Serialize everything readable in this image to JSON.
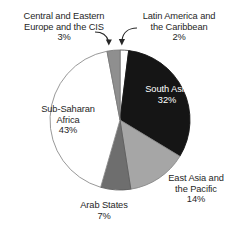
{
  "chart_data": {
    "type": "pie",
    "title": "",
    "subtitle": "",
    "xlabel": "",
    "ylabel": "",
    "grid": false,
    "legend_position": "none",
    "label_format": "name + percent",
    "start_angle_deg": 0,
    "direction": "clockwise",
    "categories": [
      "Latin America and the Caribbean",
      "South Asia",
      "East Asia and the Pacific",
      "Arab States",
      "Sub-Saharan Africa",
      "Central and Eastern Europe and the CIS"
    ],
    "values": [
      2,
      32,
      14,
      7,
      43,
      3
    ],
    "unit": "%",
    "total": 101,
    "slices": [
      {
        "name": "Latin America and the Caribbean",
        "label_line1": "Latin America and",
        "label_line2": "the Caribbean",
        "value": 2,
        "percent_label": "2%",
        "color": "#ffffff",
        "stroke": "#555555",
        "label_placement": "outside-leader"
      },
      {
        "name": "South Asia",
        "label_line1": "South Asia",
        "label_line2": "",
        "value": 32,
        "percent_label": "32%",
        "color": "#151515",
        "stroke": "#151515",
        "label_placement": "inside"
      },
      {
        "name": "East Asia and the Pacific",
        "label_line1": "East Asia and",
        "label_line2": "the Pacific",
        "value": 14,
        "percent_label": "14%",
        "color": "#a6a6a6",
        "stroke": "#8a8a8a",
        "label_placement": "outside"
      },
      {
        "name": "Arab States",
        "label_line1": "Arab States",
        "label_line2": "",
        "value": 7,
        "percent_label": "7%",
        "color": "#6e6e6e",
        "stroke": "#5e5e5e",
        "label_placement": "outside"
      },
      {
        "name": "Sub-Saharan Africa",
        "label_line1": "Sub-Saharan",
        "label_line2": "Africa",
        "value": 43,
        "percent_label": "43%",
        "color": "#ffffff",
        "stroke": "#8c8c8c",
        "label_placement": "inside"
      },
      {
        "name": "Central and Eastern Europe and the CIS",
        "label_line1": "Central and Eastern",
        "label_line2": "Europe and the CIS",
        "value": 3,
        "percent_label": "3%",
        "color": "#8f8f8f",
        "stroke": "#7a7a7a",
        "label_placement": "outside-leader"
      }
    ]
  },
  "labels": {
    "cis": {
      "line1": "Central and Eastern",
      "line2": "Europe and the CIS",
      "pct": "3%"
    },
    "latin": {
      "line1": "Latin America and",
      "line2": "the Caribbean",
      "pct": "2%"
    },
    "south_asia": {
      "line1": "South Asia",
      "pct": "32%"
    },
    "east_asia": {
      "line1": "East Asia and",
      "line2": "the Pacific",
      "pct": "14%"
    },
    "arab": {
      "line1": "Arab States",
      "pct": "7%"
    },
    "subsaharan": {
      "line1": "Sub-Saharan",
      "line2": "Africa",
      "pct": "43%"
    }
  },
  "colors": {
    "background": "#ffffff",
    "text": "#262626",
    "text_inverse": "#ffffff",
    "slice_black": "#151515",
    "slice_light_gray": "#a6a6a6",
    "slice_mid_gray": "#8f8f8f",
    "slice_dark_gray": "#6e6e6e",
    "slice_white": "#ffffff",
    "outline": "#8c8c8c",
    "leader": "#262626"
  }
}
